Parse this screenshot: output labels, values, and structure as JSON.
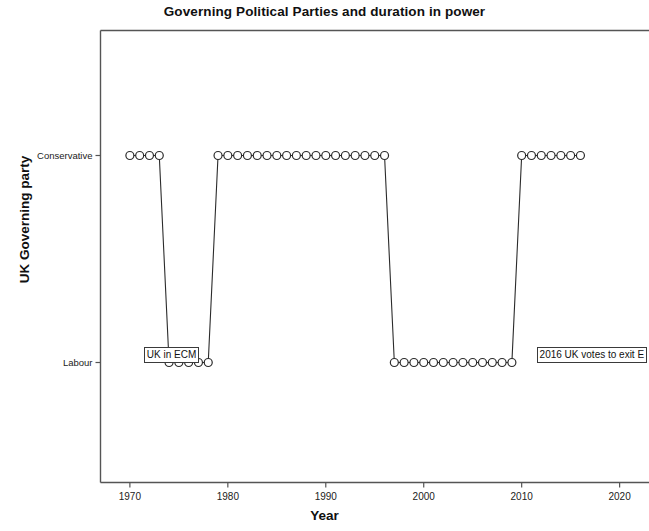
{
  "chart_data": {
    "type": "line",
    "title": "Governing Political Parties and duration in power",
    "xlabel": "Year",
    "ylabel": "UK Governing party",
    "grid": false,
    "legend": null,
    "xlim": [
      1967,
      2023
    ],
    "xticks": [
      1970,
      1980,
      1990,
      2000,
      2010,
      2020
    ],
    "xtick_labels": [
      "1970",
      "1980",
      "1990",
      "2000",
      "2010",
      "2020"
    ],
    "ycategories": [
      "Labour",
      "Conservative"
    ],
    "ytick_labels": [
      "Conservative",
      "Labour"
    ],
    "marker": "open-circle",
    "line_color": "#2b2b2b",
    "marker_edge_color": "#2b2b2b",
    "marker_face_color": "#ffffff",
    "x": [
      1970,
      1971,
      1972,
      1973,
      1974,
      1975,
      1976,
      1977,
      1978,
      1979,
      1980,
      1981,
      1982,
      1983,
      1984,
      1985,
      1986,
      1987,
      1988,
      1989,
      1990,
      1991,
      1992,
      1993,
      1994,
      1995,
      1996,
      1997,
      1998,
      1999,
      2000,
      2001,
      2002,
      2003,
      2004,
      2005,
      2006,
      2007,
      2008,
      2009,
      2010,
      2011,
      2012,
      2013,
      2014,
      2015,
      2016
    ],
    "values": [
      "Conservative",
      "Conservative",
      "Conservative",
      "Conservative",
      "Labour",
      "Labour",
      "Labour",
      "Labour",
      "Labour",
      "Conservative",
      "Conservative",
      "Conservative",
      "Conservative",
      "Conservative",
      "Conservative",
      "Conservative",
      "Conservative",
      "Conservative",
      "Conservative",
      "Conservative",
      "Conservative",
      "Conservative",
      "Conservative",
      "Conservative",
      "Conservative",
      "Conservative",
      "Conservative",
      "Labour",
      "Labour",
      "Labour",
      "Labour",
      "Labour",
      "Labour",
      "Labour",
      "Labour",
      "Labour",
      "Labour",
      "Labour",
      "Labour",
      "Labour",
      "Conservative",
      "Conservative",
      "Conservative",
      "Conservative",
      "Conservative",
      "Conservative",
      "Conservative"
    ],
    "annotations": [
      {
        "text": "UK in ECM",
        "x": 1970.2,
        "y": "Labour",
        "align": "left"
      },
      {
        "text": "2016 UK votes to exit E",
        "x": 2010.3,
        "y": "Labour",
        "align": "left"
      }
    ]
  }
}
